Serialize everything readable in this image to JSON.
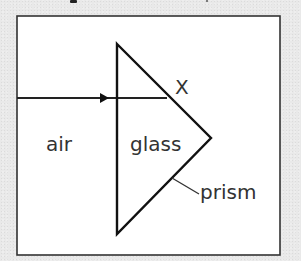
{
  "diagram": {
    "labels": {
      "air": "air",
      "glass": "glass",
      "point": "X",
      "prism": "prism"
    },
    "colors": {
      "background": "#e9e9e9",
      "panel": "#ffffff",
      "stroke": "#222222",
      "text": "#333333"
    },
    "geometry": {
      "frame": {
        "x": 17,
        "y": 16,
        "width": 263,
        "height": 239
      },
      "prism_vertices": [
        [
          117,
          44
        ],
        [
          211,
          138
        ],
        [
          117,
          234
        ]
      ],
      "ray": {
        "x1": 17,
        "y1": 98,
        "x2": 167,
        "y2": 98,
        "arrow_at_x": 108
      },
      "leader_line": {
        "x1": 172,
        "y1": 178,
        "x2": 199,
        "y2": 194
      }
    }
  }
}
